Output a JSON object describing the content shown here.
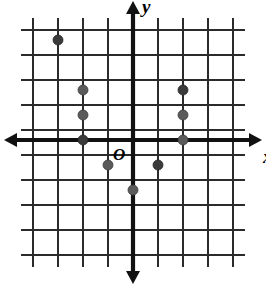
{
  "figure": {
    "kind": "coordinate-plane-scatter",
    "background_color": "#ffffff",
    "grid_color": "#2b2b2b",
    "axis_color": "#111111",
    "point_color": "#5a5a5a"
  },
  "labels": {
    "x_axis": "x",
    "y_axis": "y",
    "origin": "O"
  },
  "chart_data": {
    "type": "scatter",
    "title": "",
    "subtitle": "",
    "xlabel": "x",
    "ylabel": "y",
    "origin_label": "O",
    "grid": true,
    "legend": "none",
    "xlim": [
      -4,
      4
    ],
    "ylim": [
      -4,
      4
    ],
    "xticks": [
      -4,
      -3,
      -2,
      -1,
      0,
      1,
      2,
      3,
      4
    ],
    "yticks": [
      -4,
      -3,
      -2,
      -1,
      0,
      1,
      2,
      3,
      4
    ],
    "tick_labels_shown": false,
    "x_axis_arrows": [
      "left",
      "right"
    ],
    "y_axis_arrows": [
      "up",
      "down"
    ],
    "points": [
      {
        "x": -3,
        "y": 4
      },
      {
        "x": -2,
        "y": 2
      },
      {
        "x": -2,
        "y": 1
      },
      {
        "x": -2,
        "y": 0
      },
      {
        "x": -1,
        "y": -1
      },
      {
        "x": 0,
        "y": -2
      },
      {
        "x": 1,
        "y": -1
      },
      {
        "x": 2,
        "y": 0
      },
      {
        "x": 2,
        "y": 1
      },
      {
        "x": 2,
        "y": 2
      }
    ],
    "point_count": 10
  },
  "geometry": {
    "origin_px": {
      "x": 133,
      "y": 140
    },
    "cell_px": 25,
    "point_radius_px": 5,
    "grid_x_px": [
      33,
      58,
      83,
      108,
      133,
      158,
      183,
      208,
      233
    ],
    "grid_y_px": [
      30,
      55,
      80,
      105,
      130,
      155,
      180,
      205,
      230,
      255
    ]
  }
}
